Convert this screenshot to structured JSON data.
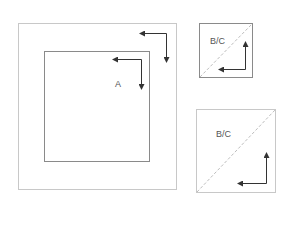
{
  "diagram": {
    "colors": {
      "frame": "#c8c8c8",
      "inner_frame": "#8a8a8a",
      "arrow": "#333333",
      "diagonal": "#bdbdbd",
      "label": "#555555"
    },
    "panel_a": {
      "label": "A",
      "outer_square": {
        "x": 18,
        "y": 23,
        "w": 158,
        "h": 166
      },
      "inner_square": {
        "x": 44,
        "y": 51,
        "w": 105,
        "h": 110
      }
    },
    "panel_b": {
      "label": "B/C",
      "square": {
        "x": 199,
        "y": 23,
        "w": 53,
        "h": 54
      }
    },
    "panel_c": {
      "label": "B/C",
      "square": {
        "x": 196,
        "y": 109,
        "w": 79,
        "h": 83
      }
    }
  }
}
